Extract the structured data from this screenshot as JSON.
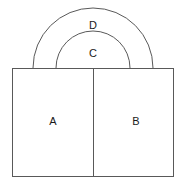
{
  "figure": {
    "canvas": {
      "width": 184,
      "height": 187
    },
    "background_color": "#ffffff",
    "line_color": "#595959",
    "label_color": "#1a1a1a",
    "fill_color": "#ffffff",
    "regions": [
      {
        "id": "region-a",
        "label": "A",
        "shape": "rectangle",
        "label_x": 53,
        "label_y": 122,
        "x": 12,
        "y": 68,
        "width": 81,
        "height": 109
      },
      {
        "id": "region-b",
        "label": "B",
        "shape": "rectangle",
        "label_x": 136,
        "label_y": 122,
        "x": 93,
        "y": 68,
        "width": 81,
        "height": 109
      },
      {
        "id": "region-c",
        "label": "C",
        "shape": "semicircular-arc",
        "label_x": 93,
        "label_y": 54,
        "center_x": 93,
        "center_y": 68,
        "radius": 37
      },
      {
        "id": "region-d",
        "label": "D",
        "shape": "semicircular-arc",
        "label_x": 93,
        "label_y": 26,
        "center_x": 93,
        "center_y": 68,
        "radius": 60
      }
    ],
    "outer_rectangle": {
      "x": 12,
      "y": 68,
      "width": 162,
      "height": 109
    },
    "divider": {
      "x": 93,
      "y_top": 68,
      "y_bottom": 177
    }
  }
}
